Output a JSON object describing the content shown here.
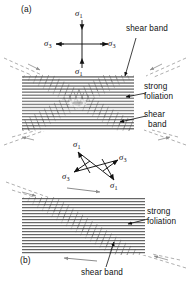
{
  "figure": {
    "width": 191,
    "height": 283,
    "background": "#ffffff",
    "ink": "#111111",
    "foliation_color": "#2b2b2b",
    "shearband_color": "#555555",
    "dashed_color": "#9a9a9a"
  },
  "panels": [
    {
      "id": "a",
      "tag": "(a)",
      "tag_x": 21,
      "tag_y": 6,
      "description": "Coaxial pure shear: vertical sigma-1 compression, horizontal sigma-3 extension, conjugate X-shaped shear bands in horizontally foliated rock",
      "stress_cross": {
        "type": "orthogonal",
        "center_x": 82,
        "center_y": 44,
        "arrows": [
          {
            "name": "sigma-1-top",
            "label": "σ",
            "sub": "1",
            "dir": "down",
            "from_x": 82,
            "from_y": 20,
            "to_x": 82,
            "to_y": 30,
            "label_x": 75,
            "label_y": 9
          },
          {
            "name": "sigma-1-bottom",
            "label": "σ",
            "sub": "1",
            "dir": "up",
            "from_x": 82,
            "from_y": 68,
            "to_x": 82,
            "to_y": 58,
            "label_x": 75,
            "label_y": 67
          },
          {
            "name": "sigma-3-left",
            "label": "σ",
            "sub": "3",
            "dir": "left",
            "from_x": 64,
            "from_y": 44,
            "to_x": 56,
            "to_y": 44,
            "label_x": 45,
            "label_y": 39
          },
          {
            "name": "sigma-3-right",
            "label": "σ",
            "sub": "3",
            "dir": "right",
            "from_x": 100,
            "from_y": 44,
            "to_x": 108,
            "to_y": 44,
            "label_x": 108,
            "label_y": 39
          }
        ]
      },
      "block": {
        "x": 22,
        "y": 75,
        "w": 112,
        "h": 56
      },
      "annotations": [
        {
          "name": "shear-band-upper",
          "text": "shear band",
          "x": 128,
          "y": 27,
          "leader_from_x": 136,
          "leader_from_y": 38,
          "leader_to_x": 124,
          "leader_to_y": 78
        },
        {
          "name": "strong-foliation",
          "text": "strong\nfoliation",
          "x": 146,
          "y": 88,
          "leader_from_x": 144,
          "leader_from_y": 95,
          "leader_to_x": 126,
          "leader_to_y": 98
        },
        {
          "name": "shear-band-lower",
          "text": "shear\nband",
          "x": 146,
          "y": 110,
          "leader_from_x": 144,
          "leader_from_y": 116,
          "leader_to_x": 120,
          "leader_to_y": 122
        }
      ]
    },
    {
      "id": "b",
      "tag": "(b)",
      "tag_x": 20,
      "tag_y": 257,
      "description": "Non-coaxial simple shear: inclined stress axes, single top-left to bottom-right shear band in horizontally foliated rock, dextral sense of shear",
      "stress_cross": {
        "type": "inclined",
        "center_x": 96,
        "center_y": 166,
        "arrows": [
          {
            "name": "sigma-1-upper-left",
            "label": "σ",
            "sub": "1",
            "dir": "up-left",
            "from_x": 90,
            "from_y": 173,
            "to_x": 78,
            "to_y": 152,
            "label_x": 74,
            "label_y": 140
          },
          {
            "name": "sigma-1-lower-right",
            "label": "σ",
            "sub": "1",
            "dir": "down-right",
            "from_x": 102,
            "from_y": 159,
            "to_x": 114,
            "to_y": 180,
            "label_x": 111,
            "label_y": 181
          },
          {
            "name": "sigma-3-upper-right",
            "label": "σ",
            "sub": "3",
            "dir": "up-right",
            "from_x": 103,
            "from_y": 172,
            "to_x": 118,
            "to_y": 160,
            "label_x": 119,
            "label_y": 153
          },
          {
            "name": "sigma-3-lower-left",
            "label": "σ",
            "sub": "3",
            "dir": "down-left",
            "from_x": 89,
            "from_y": 160,
            "to_x": 74,
            "to_y": 172,
            "label_x": 63,
            "label_y": 172
          }
        ]
      },
      "block": {
        "x": 22,
        "y": 197,
        "w": 123,
        "h": 58
      },
      "shear_sense_arrows": [
        {
          "name": "top-shear-arrow",
          "from_x": 67,
          "from_y": 188,
          "to_x": 100,
          "to_y": 192
        },
        {
          "name": "bottom-shear-arrow",
          "from_x": 97,
          "from_y": 261,
          "to_x": 64,
          "to_y": 258
        }
      ],
      "annotations": [
        {
          "name": "strong-foliation",
          "text": "strong\nfoliation",
          "x": 148,
          "y": 213,
          "leader_from_x": 146,
          "leader_from_y": 220,
          "leader_to_x": 128,
          "leader_to_y": 225
        },
        {
          "name": "shear-band",
          "text": "shear band",
          "x": 83,
          "y": 271,
          "leader_from_x": 105,
          "leader_from_y": 268,
          "leader_to_x": 113,
          "leader_to_y": 243
        }
      ]
    }
  ],
  "labels": {
    "shear_band": "shear band",
    "shear": "shear",
    "band": "band",
    "strong": "strong",
    "foliation": "foliation",
    "sigma": "σ",
    "sub_one": "1",
    "sub_three": "3",
    "tag_a": "(a)",
    "tag_b": "(b)"
  }
}
